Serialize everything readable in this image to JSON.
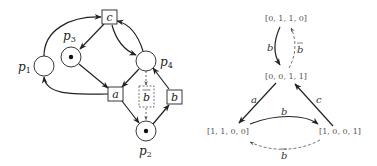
{
  "petri_net": {
    "places": [
      {
        "id": "p1",
        "label": "p",
        "sub": "1",
        "tokens": 0
      },
      {
        "id": "p2",
        "label": "p",
        "sub": "2",
        "tokens": 1
      },
      {
        "id": "p3",
        "label": "p",
        "sub": "3",
        "tokens": 1
      },
      {
        "id": "p4",
        "label": "p",
        "sub": "4",
        "tokens": 0
      }
    ],
    "transitions": [
      {
        "id": "a",
        "label": "a",
        "dashed": false
      },
      {
        "id": "b",
        "label": "b",
        "dashed": false
      },
      {
        "id": "c",
        "label": "c",
        "dashed": false
      },
      {
        "id": "bbar",
        "label": "b",
        "overline": true,
        "dashed": true
      }
    ]
  },
  "reachability_graph": {
    "states": [
      {
        "id": "s0110",
        "label": "[0, 1, 1, 0]"
      },
      {
        "id": "s0011",
        "label": "[0, 0, 1, 1]"
      },
      {
        "id": "s1100",
        "label": "[1, 1, 0, 0]"
      },
      {
        "id": "s1001",
        "label": "[1, 0, 0, 1]"
      }
    ],
    "edges": [
      {
        "from": "s0110",
        "to": "s0011",
        "label": "b",
        "dashed": false
      },
      {
        "from": "s0011",
        "to": "s0110",
        "label": "b",
        "overline": true,
        "dashed": true
      },
      {
        "from": "s0011",
        "to": "s1100",
        "label": "a",
        "dashed": false
      },
      {
        "from": "s1100",
        "to": "s1001",
        "label": "b",
        "dashed": false
      },
      {
        "from": "s1001",
        "to": "s1100",
        "label": "b",
        "overline": true,
        "dashed": true
      },
      {
        "from": "s1001",
        "to": "s0011",
        "label": "c",
        "dashed": false
      }
    ]
  }
}
